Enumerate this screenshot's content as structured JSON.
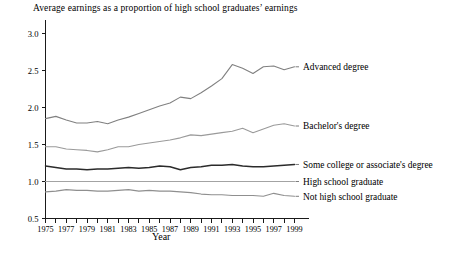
{
  "chart_data": {
    "type": "line",
    "title": "Average earnings as a proportion of high school graduates’ earnings",
    "xlabel": "Year",
    "ylabel": "",
    "grid": false,
    "legend_position": "right-inline-labels",
    "xlim": [
      1975,
      1999
    ],
    "ylim": [
      0.5,
      3.0
    ],
    "yticks": [
      "0.5",
      "1.0",
      "1.5",
      "2.0",
      "2.5",
      "3.0"
    ],
    "ytick_values": [
      0.5,
      1.0,
      1.5,
      2.0,
      2.5,
      3.0
    ],
    "x": [
      1975,
      1976,
      1977,
      1978,
      1979,
      1980,
      1981,
      1982,
      1983,
      1984,
      1985,
      1986,
      1987,
      1988,
      1989,
      1990,
      1991,
      1992,
      1993,
      1994,
      1995,
      1996,
      1997,
      1998,
      1999
    ],
    "xticks": [
      1975,
      1976,
      1977,
      1978,
      1979,
      1980,
      1981,
      1982,
      1983,
      1984,
      1985,
      1986,
      1987,
      1988,
      1989,
      1990,
      1991,
      1992,
      1993,
      1994,
      1995,
      1996,
      1997,
      1998,
      1999
    ],
    "xtick_labels": [
      "1975",
      "",
      "1977",
      "",
      "1979",
      "",
      "1981",
      "",
      "1983",
      "",
      "1985",
      "",
      "1987",
      "",
      "1989",
      "",
      "1991",
      "",
      "1993",
      "",
      "1995",
      "",
      "1997",
      "",
      "1999"
    ],
    "series": [
      {
        "name": "Advanced degree",
        "color": "#808080",
        "width": 1.1,
        "values": [
          1.85,
          1.88,
          1.83,
          1.79,
          1.79,
          1.81,
          1.78,
          1.83,
          1.87,
          1.92,
          1.97,
          2.02,
          2.06,
          2.14,
          2.12,
          2.2,
          2.29,
          2.39,
          2.58,
          2.53,
          2.46,
          2.55,
          2.56,
          2.51,
          2.55
        ]
      },
      {
        "name": "Bachelor's degree",
        "color": "#9a9a9a",
        "width": 1.1,
        "values": [
          1.47,
          1.47,
          1.44,
          1.43,
          1.42,
          1.4,
          1.43,
          1.47,
          1.47,
          1.5,
          1.52,
          1.54,
          1.56,
          1.59,
          1.63,
          1.62,
          1.64,
          1.66,
          1.68,
          1.72,
          1.66,
          1.71,
          1.76,
          1.78,
          1.75
        ]
      },
      {
        "name": "Some college or associate's degree",
        "color": "#2b2b2b",
        "width": 1.5,
        "values": [
          1.21,
          1.19,
          1.17,
          1.17,
          1.16,
          1.17,
          1.17,
          1.18,
          1.19,
          1.18,
          1.19,
          1.21,
          1.2,
          1.16,
          1.19,
          1.2,
          1.22,
          1.22,
          1.23,
          1.21,
          1.2,
          1.2,
          1.21,
          1.22,
          1.23
        ]
      },
      {
        "name": "High school graduate",
        "color": "#a3a3a3",
        "width": 1.2,
        "values": [
          1.0,
          1.0,
          1.0,
          1.0,
          1.0,
          1.0,
          1.0,
          1.0,
          1.0,
          1.0,
          1.0,
          1.0,
          1.0,
          1.0,
          1.0,
          1.0,
          1.0,
          1.0,
          1.0,
          1.0,
          1.0,
          1.0,
          1.0,
          1.0,
          1.0
        ]
      },
      {
        "name": "Not high school graduate",
        "color": "#8f8f8f",
        "width": 1.1,
        "values": [
          0.86,
          0.87,
          0.89,
          0.88,
          0.88,
          0.87,
          0.87,
          0.88,
          0.89,
          0.87,
          0.88,
          0.87,
          0.87,
          0.86,
          0.85,
          0.83,
          0.82,
          0.82,
          0.81,
          0.81,
          0.81,
          0.8,
          0.84,
          0.81,
          0.8
        ]
      }
    ],
    "annotations": [
      {
        "text": "Advanced degree",
        "at_x": 1999,
        "at_y": 2.55
      },
      {
        "text": "Bachelor's degree",
        "at_x": 1999,
        "at_y": 1.75
      },
      {
        "text": "Some college or associate's degree",
        "at_x": 1999,
        "at_y": 1.23
      },
      {
        "text": "High school graduate",
        "at_x": 1999,
        "at_y": 1.0
      },
      {
        "text": "Not high school graduate",
        "at_x": 1999,
        "at_y": 0.8
      }
    ]
  }
}
